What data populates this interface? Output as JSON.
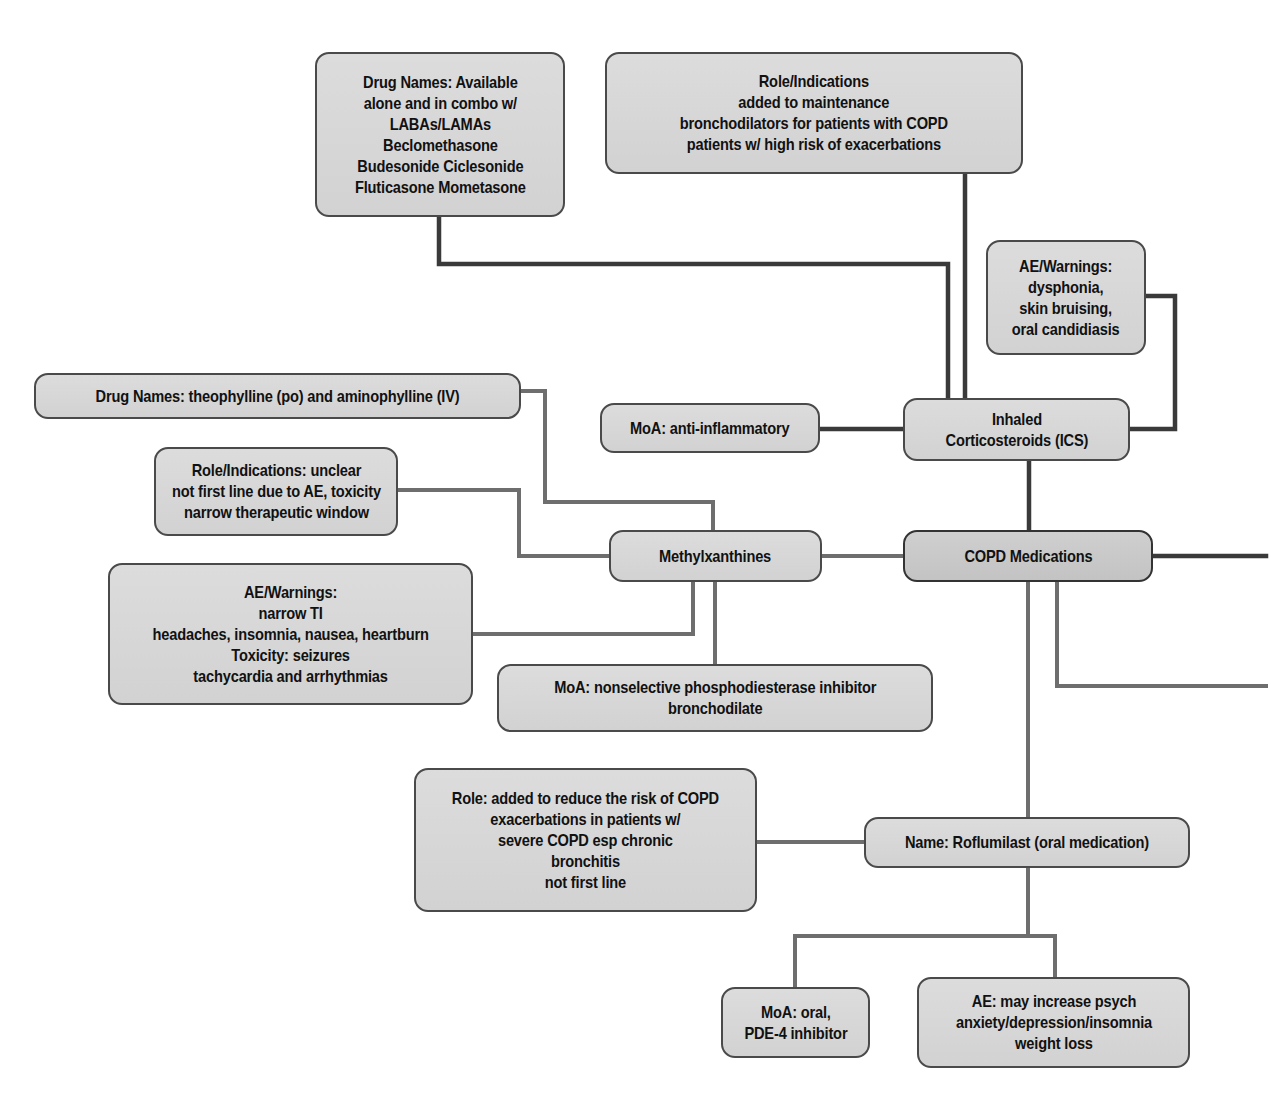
{
  "colors": {
    "node_fill": "#d6d6d6",
    "node_border": "#4a4a4a",
    "connector_dark": "#3a3a3a",
    "connector_light": "#6e6e6e",
    "background": "#ffffff"
  },
  "nodes": {
    "copd_medications": {
      "lines": [
        "COPD Medications"
      ]
    },
    "ics": {
      "lines": [
        "Inhaled",
        "Corticosteroids (ICS)"
      ]
    },
    "ics_drug_names": {
      "lines": [
        "Drug Names: Available",
        "alone and in combo w/",
        "LABAs/LAMAs",
        "Beclomethasone",
        "Budesonide Ciclesonide",
        "Fluticasone Mometasone"
      ]
    },
    "ics_role": {
      "lines": [
        "Role/Indications",
        "added to maintenance",
        "bronchodilators for patients with COPD",
        "patients w/ high risk of exacerbations"
      ]
    },
    "ics_ae": {
      "lines": [
        "AE/Warnings:",
        "dysphonia,",
        "skin bruising,",
        "oral candidiasis"
      ]
    },
    "ics_moa": {
      "lines": [
        "MoA: anti-inflammatory"
      ]
    },
    "methylxanthines": {
      "lines": [
        "Methylxanthines"
      ]
    },
    "mx_drug_names": {
      "lines": [
        "Drug Names: theophylline (po) and aminophylline (IV)"
      ]
    },
    "mx_role": {
      "lines": [
        "Role/Indications: unclear",
        "not first line due to AE, toxicity",
        "narrow therapeutic window"
      ]
    },
    "mx_ae": {
      "lines": [
        "AE/Warnings:",
        "narrow TI",
        "headaches, insomnia, nausea, heartburn",
        "Toxicity: seizures",
        "tachycardia and arrhythmias"
      ]
    },
    "mx_moa": {
      "lines": [
        "MoA: nonselective phosphodiesterase inhibitor",
        "bronchodilate"
      ]
    },
    "roflumilast": {
      "lines": [
        "Name: Roflumilast (oral medication)"
      ]
    },
    "rf_role": {
      "lines": [
        "Role: added to reduce the risk of COPD",
        "exacerbations in patients w/",
        "severe COPD esp chronic",
        "bronchitis",
        "not first line"
      ]
    },
    "rf_moa": {
      "lines": [
        "MoA: oral,",
        "PDE-4 inhibitor"
      ]
    },
    "rf_ae": {
      "lines": [
        "AE: may increase psych",
        "anxiety/depression/insomnia",
        "weight loss"
      ]
    }
  }
}
